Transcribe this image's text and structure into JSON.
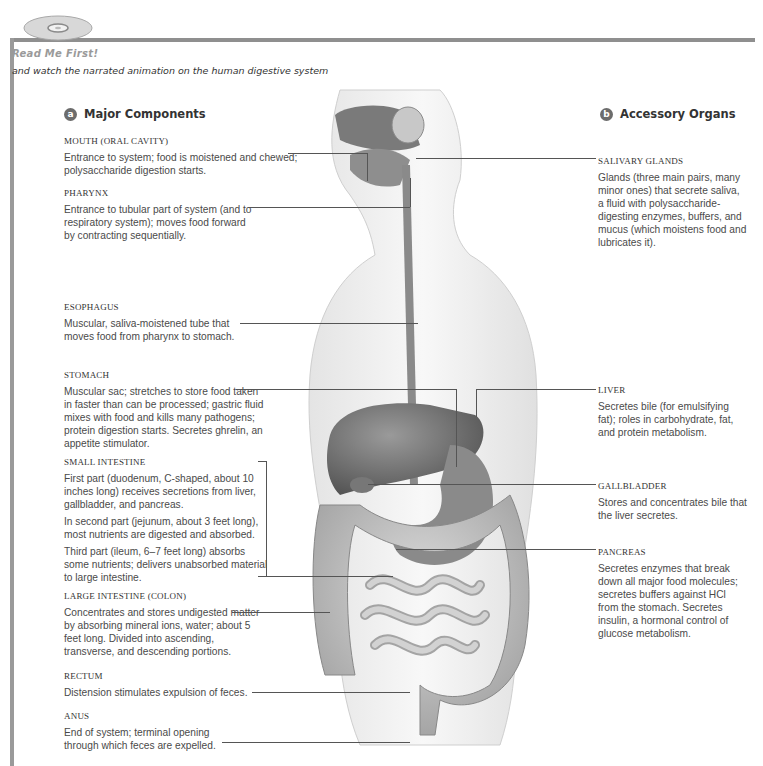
{
  "header": {
    "badge_text": "Read Me First!",
    "subtitle": "and watch the narrated animation on the human digestive system",
    "cd_icon": "cd-disc-icon"
  },
  "section_a": {
    "marker": "a",
    "title": "Major Components",
    "items": [
      {
        "label": "MOUTH (ORAL CAVITY)",
        "text": [
          "Entrance to system; food is moistened and chewed; polysaccharide digestion starts."
        ]
      },
      {
        "label": "PHARYNX",
        "text": [
          "Entrance to tubular part of system (and to respiratory system); moves food forward by contracting sequentially."
        ]
      },
      {
        "label": "ESOPHAGUS",
        "text": [
          "Muscular, saliva-moistened tube that moves food from pharynx to stomach."
        ]
      },
      {
        "label": "STOMACH",
        "text": [
          "Muscular sac; stretches to store food taken in faster than can be processed; gastric fluid mixes with food and kills many pathogens; protein digestion starts. Secretes ghrelin, an appetite stimulator."
        ]
      },
      {
        "label": "SMALL INTESTINE",
        "text": [
          "First part (duodenum, C-shaped, about 10 inches long) receives secretions from liver, gallbladder, and pancreas.",
          "In second part (jejunum, about 3 feet long), most nutrients are digested and absorbed.",
          "Third part (ileum, 6–7 feet long) absorbs some nutrients; delivers unabsorbed material to large intestine."
        ]
      },
      {
        "label": "LARGE INTESTINE (COLON)",
        "text": [
          "Concentrates and stores undigested matter by absorbing mineral ions, water; about 5 feet long. Divided into ascending, transverse, and descending portions."
        ]
      },
      {
        "label": "RECTUM",
        "text": [
          "Distension stimulates expulsion of feces."
        ]
      },
      {
        "label": "ANUS",
        "text": [
          "End of system; terminal opening through which feces are expelled."
        ]
      }
    ]
  },
  "section_b": {
    "marker": "b",
    "title": "Accessory Organs",
    "items": [
      {
        "label": "SALIVARY GLANDS",
        "text": [
          "Glands (three main pairs, many minor ones) that secrete saliva, a fluid with polysaccharide-digesting enzymes, buffers, and mucus (which moistens food and lubricates it)."
        ]
      },
      {
        "label": "LIVER",
        "text": [
          "Secretes bile (for emulsifying fat); roles in carbohydrate, fat, and protein metabolism."
        ]
      },
      {
        "label": "GALLBLADDER",
        "text": [
          "Stores and concentrates bile that the liver secretes."
        ]
      },
      {
        "label": "PANCREAS",
        "text": [
          "Secretes enzymes that break down all major food molecules; secretes buffers against HCl from the stomach. Secretes insulin, a hormonal control of glucose metabolism."
        ]
      }
    ]
  }
}
